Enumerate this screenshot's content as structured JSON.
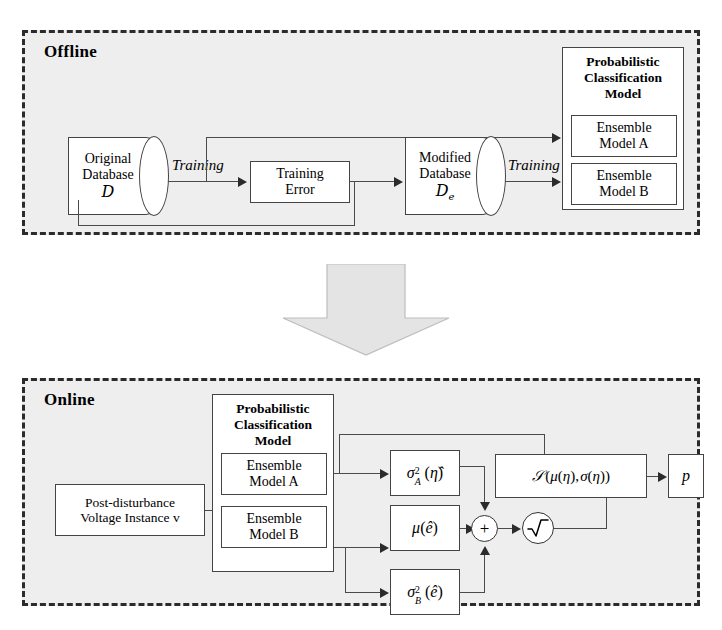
{
  "figure": {
    "type": "flow-diagram"
  },
  "offline": {
    "stage_label": "Offline",
    "original_db": {
      "line1": "Original",
      "line2": "Database",
      "symbol": "D"
    },
    "training_error": {
      "label": "Training\nError"
    },
    "modified_db": {
      "line1": "Modified",
      "line2": "Database",
      "symbol": "D",
      "subscript": "e"
    },
    "edge_label_1": "Training",
    "edge_label_2": "Training",
    "model_group": {
      "title": "Probabilistic\nClassification\nModel",
      "model_a": "Ensemble\nModel A",
      "model_b": "Ensemble\nModel B"
    }
  },
  "online": {
    "stage_label": "Online",
    "input": {
      "label": "Post-disturbance\nVoltage Instance v"
    },
    "model_group": {
      "title": "Probabilistic\nClassification\nModel",
      "model_a": "Ensemble\nModel A",
      "model_b": "Ensemble\nModel B"
    },
    "nodes": {
      "sigma_a": "σ²_A(η̂)",
      "mu_e": "μ(ê)",
      "sigma_b": "σ²_B(ê)",
      "normal": "𝒩(μ(η), σ(η))",
      "sum": "+",
      "sqrt": "√",
      "output": "p"
    }
  },
  "colors": {
    "panel_background": "#eeeeee",
    "panel_border": "#2b2b2b",
    "box_border": "#444444",
    "box_fill": "#ffffff",
    "connector": "#4a4a4a",
    "big_arrow_fill": "#e3e3e3",
    "big_arrow_stroke": "#b9b9b9",
    "text": "#000000"
  }
}
